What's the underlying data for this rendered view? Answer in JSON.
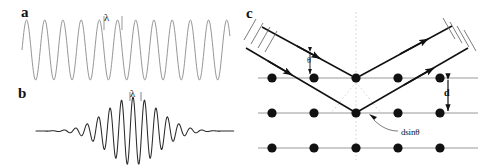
{
  "figure": {
    "width": 484,
    "height": 166,
    "background": "#ffffff",
    "ink": "#111111"
  },
  "panels": {
    "a": {
      "label": "a",
      "caption": "continuous monochromatic wave",
      "wavelength_symbol": "λ",
      "stroke": "#8a8a8a"
    },
    "b": {
      "label": "b",
      "caption": "gaussian wave packet",
      "wavelength_symbol": "λ",
      "stroke": "#2a2a2a"
    },
    "c": {
      "label": "c",
      "caption": "Bragg reflection from lattice planes",
      "theta_symbol": "θ",
      "spacing_symbol": "d",
      "path_difference_label": "dsinθ",
      "stroke": "#111111",
      "lattice_rows": 3,
      "atoms_per_row": 5,
      "atom_color": "#111111",
      "plane_color": "#8d8d8d",
      "guide_color": "#c9c9c9"
    }
  },
  "chart_data": [
    {
      "type": "line",
      "id": "panel-a-wave",
      "title": "a",
      "annotations": [
        "λ"
      ],
      "xlabel": "",
      "ylabel": "",
      "description": "Uniform sinusoid, constant amplitude, ~11 full cycles",
      "cycles": 11,
      "amplitude": 30,
      "wavelength_px": 18.2,
      "baseline_y": 50,
      "x_start": 22,
      "x_end": 230,
      "grid": false,
      "legend": false
    },
    {
      "type": "line",
      "id": "panel-b-wavepacket",
      "title": "b",
      "annotations": [
        "λ"
      ],
      "xlabel": "",
      "ylabel": "",
      "description": "Gaussian-enveloped wave packet with flat tails",
      "cycles": 13,
      "peak_amplitude": 34,
      "wavelength_px": 11.5,
      "envelope": "gaussian",
      "envelope_center_x": 133,
      "envelope_sigma": 26,
      "baseline_y": 131,
      "x_start": 58,
      "x_end": 212,
      "grid": false,
      "legend": false
    },
    {
      "type": "diagram",
      "id": "panel-c-bragg",
      "title": "c",
      "description": "Two parallel X-ray beams incident at angle theta reflect from successive lattice planes separated by d; extra path length is d sin(theta).",
      "labels": [
        "θ",
        "d",
        "dsinθ"
      ],
      "lattice": {
        "rows_y": [
          78,
          113,
          148
        ],
        "atoms_x": [
          272,
          314,
          356,
          398,
          440
        ],
        "atom_radius": 4.6,
        "interplanar_spacing_px": 35
      },
      "rays": {
        "incident_angle_deg": 40,
        "apex_upper": [
          356,
          78
        ],
        "apex_lower": [
          356,
          113
        ],
        "wavefront_ticks": 4
      }
    }
  ]
}
